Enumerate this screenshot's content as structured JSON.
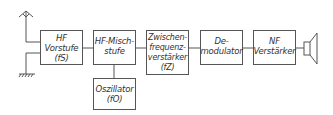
{
  "diagram": {
    "line_color": "#555555",
    "blocks": [
      {
        "id": "hf-vorstufe",
        "lines": [
          "HF",
          "Vorstufe",
          "(fS)"
        ]
      },
      {
        "id": "hf-mischstufe",
        "lines": [
          "HF-Misch-",
          "stufe"
        ]
      },
      {
        "id": "zf-verstaerker",
        "lines": [
          "Zwischen-",
          "frequenz-",
          "verstärker",
          "(fZ)"
        ]
      },
      {
        "id": "demodulator",
        "lines": [
          "De-",
          "modulator"
        ]
      },
      {
        "id": "nf-verstaerker",
        "lines": [
          "NF",
          "Verstärker"
        ]
      },
      {
        "id": "oszillator",
        "lines": [
          "Oszillator",
          "(fO)"
        ]
      }
    ],
    "icons": {
      "antenna": "antenna-icon",
      "ground": "ground-icon",
      "speaker": "speaker-icon"
    },
    "connections": [
      [
        "antenna",
        "hf-vorstufe"
      ],
      [
        "ground",
        "hf-vorstufe"
      ],
      [
        "hf-vorstufe",
        "hf-mischstufe"
      ],
      [
        "hf-mischstufe",
        "zf-verstaerker"
      ],
      [
        "zf-verstaerker",
        "demodulator"
      ],
      [
        "demodulator",
        "nf-verstaerker"
      ],
      [
        "nf-verstaerker",
        "speaker"
      ],
      [
        "oszillator",
        "hf-mischstufe"
      ]
    ]
  }
}
